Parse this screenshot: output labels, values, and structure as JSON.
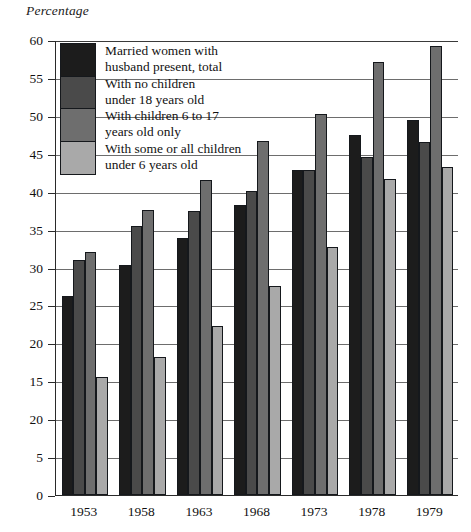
{
  "chart_data": {
    "type": "bar",
    "title": "",
    "ylabel": "Percentage",
    "xlabel": "",
    "ylim": [
      0,
      60
    ],
    "ytick_step": 5,
    "ytick_labels": [
      "60",
      "55",
      "50",
      "45",
      "40",
      "35",
      "30",
      "25",
      "20",
      "15",
      "20",
      "5",
      "0"
    ],
    "ytick_values": [
      60,
      55,
      50,
      45,
      40,
      35,
      30,
      25,
      20,
      15,
      10,
      5,
      0
    ],
    "grid": true,
    "legend_position": "upper-left-inside",
    "categories": [
      "1953",
      "1958",
      "1963",
      "1968",
      "1973",
      "1978",
      "1979"
    ],
    "series": [
      {
        "name": "Married women with husband present, total",
        "color": "#1c1c1c",
        "values": [
          26.3,
          30.3,
          33.9,
          38.2,
          42.8,
          47.5,
          49.4
        ]
      },
      {
        "name": "With no children under 18 years old",
        "color": "#4a4a4a",
        "values": [
          31.0,
          35.5,
          37.4,
          40.1,
          42.8,
          44.6,
          46.6
        ]
      },
      {
        "name": "With children 6 to 17 years old only",
        "color": "#6e6e6e",
        "values": [
          32.1,
          37.6,
          41.5,
          46.7,
          50.2,
          57.1,
          59.2
        ]
      },
      {
        "name": "With some or all children under 6 years old",
        "color": "#a9a9a9",
        "values": [
          15.5,
          18.2,
          22.3,
          27.6,
          32.7,
          41.7,
          43.2
        ]
      }
    ]
  },
  "legend": {
    "entries": [
      {
        "label": "Married women with\nhusband present, total",
        "swatch": "s0"
      },
      {
        "label": "With no children\nunder 18 years old",
        "swatch": "s1"
      },
      {
        "label": "With children 6 to 17\nyears old only",
        "swatch": "s2"
      },
      {
        "label": "With some or all children\nunder 6 years old",
        "swatch": "s3"
      }
    ]
  }
}
